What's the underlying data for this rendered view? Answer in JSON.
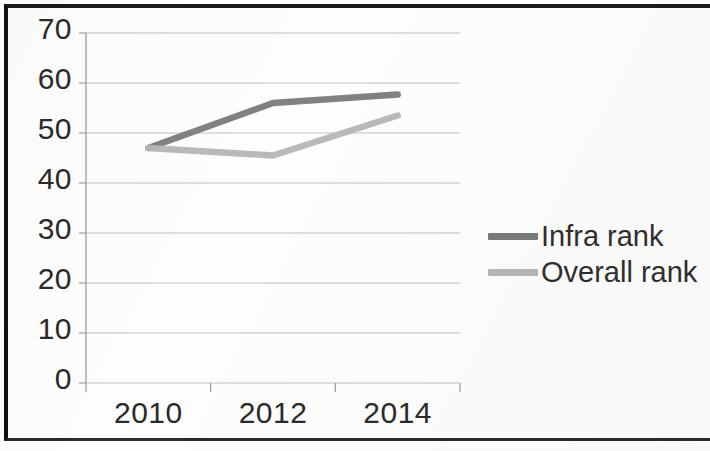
{
  "chart_data": {
    "type": "line",
    "title": "",
    "subtitle": "",
    "xlabel": "",
    "ylabel": "",
    "categories": [
      "2010",
      "2012",
      "2014"
    ],
    "x_tick_labels": [
      "2010",
      "2012",
      "2014"
    ],
    "y_tick_labels": [
      "0",
      "10",
      "20",
      "30",
      "40",
      "50",
      "60",
      "70"
    ],
    "y_ticks": [
      0,
      10,
      20,
      30,
      40,
      50,
      60,
      70
    ],
    "ylim": [
      0,
      70
    ],
    "grid": "horizontal",
    "legend_position": "right",
    "series": [
      {
        "name": "Infra rank",
        "color": "#7a7a7a",
        "values": [
          47,
          56,
          57.7
        ]
      },
      {
        "name": "Overall rank",
        "color": "#b5b5b5",
        "values": [
          47,
          45.5,
          53.5
        ]
      }
    ]
  },
  "legend": {
    "items": [
      {
        "label": "Infra rank",
        "color": "#7a7a7a"
      },
      {
        "label": "Overall rank",
        "color": "#b5b5b5"
      }
    ]
  },
  "axis": {
    "axis_line_color": "#9a9a9a",
    "gridline_color": "#b8b8b8",
    "tick_text_color": "#2a2a2a"
  },
  "frame": {
    "border_color": "#111111",
    "background": "#fdfdfc"
  }
}
